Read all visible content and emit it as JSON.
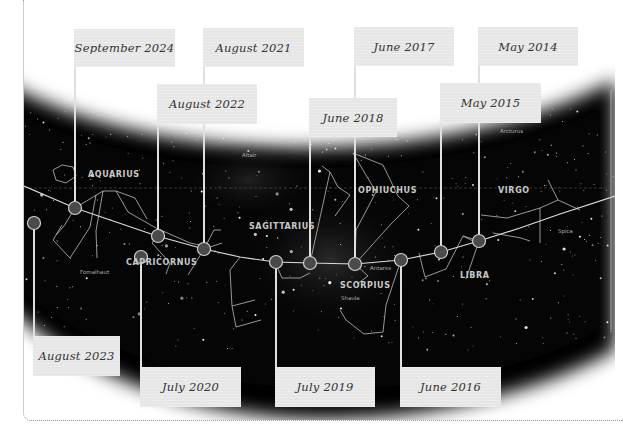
{
  "diagram": {
    "type": "star-chart-timeline",
    "colors": {
      "sky": "#050505",
      "label_box": "#e6e6e6",
      "marker_fill": "#4a4a4a",
      "marker_stroke": "#d0d0d0",
      "line": "#d8d8d8",
      "constellation_label": "#c9c9c9"
    },
    "constellations": [
      {
        "name": "AQUARIUS",
        "x": 88,
        "y": 178
      },
      {
        "name": "CAPRICORNUS",
        "x": 126,
        "y": 266
      },
      {
        "name": "SAGITTARIUS",
        "x": 249,
        "y": 230
      },
      {
        "name": "OPHIUCHUS",
        "x": 358,
        "y": 194
      },
      {
        "name": "SCORPIUS",
        "x": 340,
        "y": 289
      },
      {
        "name": "LIBRA",
        "x": 460,
        "y": 279
      },
      {
        "name": "VIRGO",
        "x": 498,
        "y": 194
      }
    ],
    "stars": [
      {
        "name": "Altair",
        "x": 242,
        "y": 157
      },
      {
        "name": "Fomalhaut",
        "x": 80,
        "y": 274
      },
      {
        "name": "Antares",
        "x": 370,
        "y": 270
      },
      {
        "name": "Shaula",
        "x": 341,
        "y": 300
      },
      {
        "name": "Arcturus",
        "x": 500,
        "y": 133
      },
      {
        "name": "Spica",
        "x": 558,
        "y": 233
      }
    ],
    "markers": [
      {
        "date": "September 2024",
        "cx": 75,
        "cy": 208,
        "box": {
          "x": 74,
          "y": 29,
          "w": 101,
          "h": 38
        },
        "position": "top"
      },
      {
        "date": "August 2023",
        "cx": 119,
        "cy": 223,
        "box": {
          "x": 33,
          "y": 336,
          "w": 87,
          "h": 40
        },
        "position": "bottom"
      },
      {
        "date": "August 2022",
        "cx": 157,
        "cy": 236,
        "box": {
          "x": 157,
          "y": 84,
          "w": 100,
          "h": 40
        },
        "position": "top"
      },
      {
        "date": "August 2021",
        "cx": 204,
        "cy": 249,
        "box": {
          "x": 203,
          "y": 28,
          "w": 101,
          "h": 39
        },
        "position": "top"
      },
      {
        "date": "July 2020",
        "cx": 240,
        "cy": 257,
        "box": {
          "x": 140,
          "y": 367,
          "w": 101,
          "h": 40
        },
        "position": "bottom"
      },
      {
        "date": "July 2019",
        "cx": 275,
        "cy": 262,
        "box": {
          "x": 275,
          "y": 367,
          "w": 100,
          "h": 40
        },
        "position": "bottom"
      },
      {
        "date": "June 2018",
        "cx": 310,
        "cy": 263,
        "box": {
          "x": 309,
          "y": 98,
          "w": 88,
          "h": 39
        },
        "position": "top"
      },
      {
        "date": "June 2017",
        "cx": 355,
        "cy": 264,
        "box": {
          "x": 354,
          "y": 27,
          "w": 100,
          "h": 39
        },
        "position": "top"
      },
      {
        "date": "June 2016",
        "cx": 401,
        "cy": 260,
        "box": {
          "x": 400,
          "y": 367,
          "w": 101,
          "h": 40
        },
        "position": "bottom"
      },
      {
        "date": "May 2015",
        "cx": 441,
        "cy": 252,
        "box": {
          "x": 440,
          "y": 83,
          "w": 101,
          "h": 40
        },
        "position": "top"
      },
      {
        "date": "May 2014",
        "cx": 479,
        "cy": 241,
        "box": {
          "x": 478,
          "y": 27,
          "w": 100,
          "h": 39
        },
        "position": "top"
      }
    ]
  }
}
